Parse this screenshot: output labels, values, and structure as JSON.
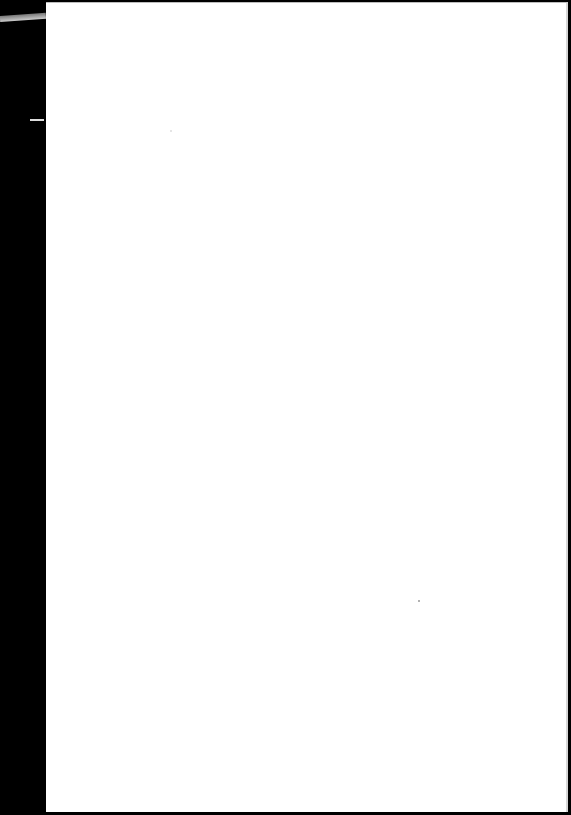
{
  "document": {
    "type": "scanned-page",
    "content": "",
    "colors": {
      "page": "#ffffff",
      "edge": "#000000"
    }
  }
}
